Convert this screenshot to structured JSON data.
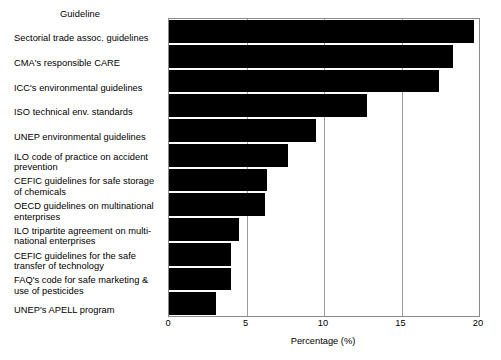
{
  "chart_data": {
    "type": "bar",
    "orientation": "horizontal",
    "title": "",
    "xlabel": "Percentage (%)",
    "ylabel": "Guideline",
    "xlim": [
      0,
      20
    ],
    "xticks": [
      "0",
      "5",
      "10",
      "15",
      "20"
    ],
    "grid": true,
    "legend": false,
    "bar_color": "#000000",
    "categories": [
      "Sectorial trade assoc. guidelines",
      "CMA's responsible CARE",
      "ICC's environmental guidelines",
      "ISO technical env. standards",
      "UNEP environmental guidelines",
      "ILO code of practice on accident prevention",
      "CEFIC guidelines for safe storage of chemicals",
      "OECD guidelines on multinational enterprises",
      "ILO tripartite agreement on multi-national enterprises",
      "CEFIC guidelines for the safe transfer of technology",
      "FAQ's code for safe marketing & use of pesticides",
      "UNEP's APELL program"
    ],
    "category_lines": [
      [
        "Sectorial trade assoc. guidelines"
      ],
      [
        "CMA's responsible CARE"
      ],
      [
        "ICC's environmental guidelines"
      ],
      [
        "ISO technical env. standards"
      ],
      [
        "UNEP environmental guidelines"
      ],
      [
        "ILO code of practice on accident",
        "prevention"
      ],
      [
        "CEFIC guidelines for safe storage",
        "of chemicals"
      ],
      [
        "OECD guidelines on multinational",
        "enterprises"
      ],
      [
        "ILO tripartite agreement on multi-",
        "national enterprises"
      ],
      [
        "CEFIC guidelines for the safe",
        "transfer of technology"
      ],
      [
        "FAQ's code for safe marketing &",
        "use of pesticides"
      ],
      [
        "UNEP's APELL program"
      ]
    ],
    "values": [
      19.7,
      18.3,
      17.4,
      12.8,
      9.5,
      7.7,
      6.3,
      6.2,
      4.5,
      4.0,
      4.0,
      3.0
    ]
  }
}
